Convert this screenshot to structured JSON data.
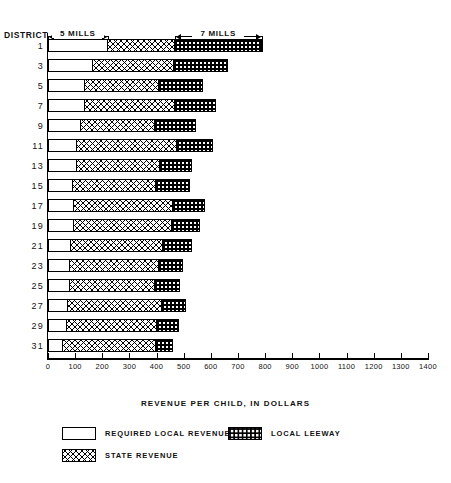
{
  "labels": {
    "district_heading": "DISTRICT",
    "mills_low": "5 MILLS",
    "mills_high": "7 MILLS",
    "axis_title": "REVENUE PER CHILD, IN DOLLARS"
  },
  "legend": [
    {
      "key": "required",
      "label": "REQUIRED LOCAL  REVENUE",
      "swatch": "white"
    },
    {
      "key": "leeway",
      "label": "LOCAL LEEWAY",
      "swatch": "leeway"
    },
    {
      "key": "state",
      "label": "STATE REVENUE",
      "swatch": "state"
    }
  ],
  "chart_data": {
    "type": "bar",
    "orientation": "horizontal",
    "stacked": true,
    "title": "",
    "xlabel": "REVENUE PER CHILD, IN DOLLARS",
    "ylabel": "DISTRICT",
    "xlim": [
      0,
      1400
    ],
    "xticks": [
      0,
      100,
      200,
      300,
      400,
      500,
      600,
      700,
      800,
      900,
      1000,
      1100,
      1200,
      1300,
      1400
    ],
    "xticklabels": [
      "0",
      "100",
      "200",
      "300",
      "400",
      "500",
      "600",
      "700",
      "800",
      "900",
      "1000",
      "1100",
      "1200",
      "1300",
      "1400"
    ],
    "grid": false,
    "legend_position": "below",
    "categories": [
      "1",
      "3",
      "5",
      "7",
      "9",
      "11",
      "13",
      "15",
      "17",
      "19",
      "21",
      "23",
      "25",
      "27",
      "29",
      "31"
    ],
    "series": [
      {
        "name": "REQUIRED LOCAL  REVENUE",
        "fill": "white",
        "values": [
          220,
          165,
          133,
          133,
          118,
          103,
          103,
          88,
          92,
          92,
          81,
          77,
          77,
          70,
          66,
          52
        ]
      },
      {
        "name": "STATE REVENUE",
        "fill": "crosshatch",
        "values": [
          247,
          302,
          276,
          335,
          276,
          376,
          310,
          313,
          372,
          368,
          343,
          335,
          320,
          354,
          339,
          350
        ]
      },
      {
        "name": "LOCAL LEEWAY",
        "fill": "dotted",
        "values": [
          320,
          195,
          162,
          151,
          151,
          129,
          118,
          121,
          114,
          99,
          107,
          85,
          88,
          85,
          77,
          59
        ]
      }
    ],
    "annotations": [
      {
        "text": "5 MILLS",
        "x_start": 0,
        "x_end": 220
      },
      {
        "text": "7 MILLS",
        "x_start": 467,
        "x_end": 787
      }
    ]
  }
}
